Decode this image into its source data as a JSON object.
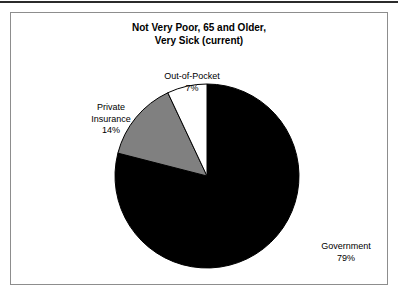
{
  "chart_data": {
    "type": "pie",
    "title": "Not Very Poor, 65 and Older, Very Sick (current)",
    "title_line1": "Not Very Poor, 65 and Older,",
    "title_line2": "Very Sick (current)",
    "categories": [
      "Out-of-Pocket",
      "Private Insurance",
      "Government"
    ],
    "values": [
      7,
      14,
      79
    ],
    "value_labels": [
      "7%",
      "14%",
      "79%"
    ],
    "unit": "%",
    "start_angle_deg": 0,
    "direction": "counterclockwise",
    "legend": "none",
    "grid": false,
    "slices": [
      {
        "label": "Out-of-Pocket",
        "label_line1": "Out-of-Pocket",
        "value": 7,
        "value_label": "7%",
        "color": "#ffffff",
        "stroke": "#000000"
      },
      {
        "label": "Private Insurance",
        "label_line1": "Private",
        "label_line2": "Insurance",
        "value": 14,
        "value_label": "14%",
        "color": "#808080",
        "stroke": "#000000"
      },
      {
        "label": "Government",
        "label_line1": "Government",
        "value": 79,
        "value_label": "79%",
        "color": "#000000",
        "stroke": "#000000"
      }
    ]
  },
  "frame": {
    "border_color": "#8d8d8d",
    "background": "#ffffff",
    "top_rule_color": "#2b2b2b"
  }
}
